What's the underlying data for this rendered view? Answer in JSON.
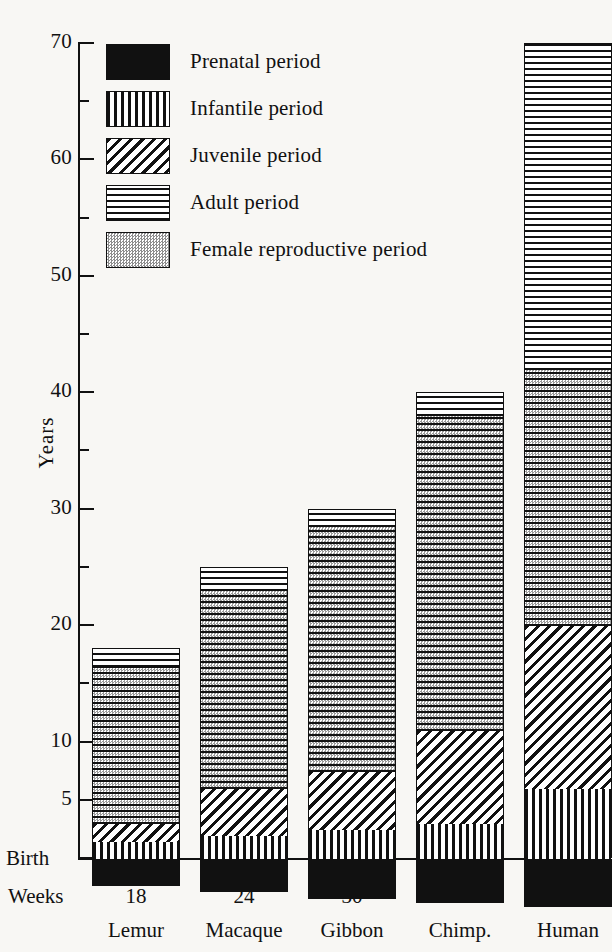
{
  "figure": {
    "y_axis_title": "Years",
    "birth_label": "Birth",
    "weeks_label": "Weeks",
    "background_color": "#f8f7f4",
    "ink_color": "#111111"
  },
  "legend": {
    "items": [
      {
        "label": "Prenatal period",
        "pattern": "solid-black",
        "swatch": "pat-prenatal"
      },
      {
        "label": "Infantile period",
        "pattern": "vertical-lines",
        "swatch": "pat-infantile"
      },
      {
        "label": "Juvenile period",
        "pattern": "diagonal-lines",
        "swatch": "pat-juvenile"
      },
      {
        "label": "Adult period",
        "pattern": "horizontal-lines",
        "swatch": "pat-adult"
      },
      {
        "label": "Female reproductive period",
        "pattern": "stipple-gray",
        "swatch": "pat-repro-swatch"
      }
    ]
  },
  "chart_data": {
    "type": "bar",
    "title": "",
    "subtitle": "",
    "xlabel": "",
    "ylabel": "Years",
    "ylim": [
      0,
      70
    ],
    "grid": false,
    "legend_position": "top-left",
    "stacked": true,
    "categories": [
      "Lemur",
      "Macaque",
      "Gibbon",
      "Chimp.",
      "Human"
    ],
    "gestation_weeks": [
      18,
      24,
      30,
      34,
      38
    ],
    "y_major_ticks": [
      "Birth",
      "5",
      "10",
      "20",
      "30",
      "40",
      "50",
      "60",
      "70"
    ],
    "y_major_tick_values": [
      0,
      5,
      10,
      20,
      30,
      40,
      50,
      60,
      70
    ],
    "y_minor_tick_values": [
      15,
      25,
      35,
      45,
      55,
      65
    ],
    "series": [
      {
        "name": "Prenatal period",
        "values": [
          -1.6,
          -2.1,
          -2.6,
          -2.9,
          -3.3
        ],
        "note": "drawn below the birth line, scaled to gestation weeks"
      },
      {
        "name": "Infantile period",
        "values": [
          1.5,
          2.0,
          2.5,
          3.0,
          6.0
        ]
      },
      {
        "name": "Juvenile period",
        "values": [
          1.5,
          4.0,
          5.0,
          8.0,
          14.0
        ]
      },
      {
        "name": "Female reproductive period",
        "values": [
          13.5,
          17.0,
          21.0,
          27.0,
          22.0
        ]
      },
      {
        "name": "Adult period",
        "values": [
          1.5,
          2.0,
          1.5,
          2.0,
          28.0
        ]
      }
    ],
    "totals": [
      18,
      25,
      30,
      40,
      70
    ],
    "boundaries": [
      {
        "category": "Lemur",
        "infantile_end": 1.5,
        "juvenile_end": 3.0,
        "repro_end": 16.5,
        "total": 18
      },
      {
        "category": "Macaque",
        "infantile_end": 2.0,
        "juvenile_end": 6.0,
        "repro_end": 23.0,
        "total": 25
      },
      {
        "category": "Gibbon",
        "infantile_end": 2.5,
        "juvenile_end": 7.5,
        "repro_end": 28.5,
        "total": 30
      },
      {
        "category": "Chimp.",
        "infantile_end": 3.0,
        "juvenile_end": 11.0,
        "repro_end": 38.0,
        "total": 40
      },
      {
        "category": "Human",
        "infantile_end": 6.0,
        "juvenile_end": 20.0,
        "repro_end": 42.0,
        "total": 70
      }
    ]
  }
}
